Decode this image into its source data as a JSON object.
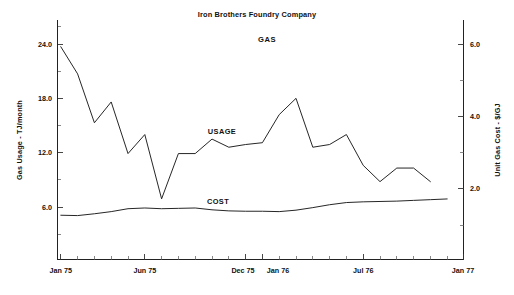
{
  "chart_data": {
    "type": "line",
    "title": "Iron Brothers Foundry Company",
    "subtitle": "GAS",
    "xlabel": "",
    "ylabel": "Gas Usage - TJ/month",
    "y2label": "Unit Gas Cost - $/GJ",
    "grid": false,
    "legend_position": "inline-annotation",
    "xlim": [
      "Jan 75",
      "Jan 77"
    ],
    "ylim": [
      0.0,
      26.0
    ],
    "y2lim": [
      0.0,
      6.5
    ],
    "yticks": [
      "6.0",
      "12.0",
      "18.0",
      "24.0"
    ],
    "ytick_values": [
      6.0,
      12.0,
      18.0,
      24.0
    ],
    "y2ticks": [
      "2.0",
      "4.0",
      "6.0"
    ],
    "y2tick_values": [
      2.0,
      4.0,
      6.0
    ],
    "xticks": [
      "Jan 75",
      "Jun 75",
      "Dec 75",
      "Jan 76",
      "Jul 76",
      "Jan 77"
    ],
    "xtick_months": [
      0,
      5,
      11,
      12,
      18,
      24
    ],
    "x_months": [
      0,
      1,
      2,
      3,
      4,
      5,
      6,
      7,
      8,
      9,
      10,
      11,
      12,
      13,
      14,
      15,
      16,
      17,
      18,
      19,
      20,
      21,
      22,
      23
    ],
    "series": [
      {
        "name": "USAGE",
        "axis": "left",
        "units": "TJ/month",
        "values": [
          23.7,
          20.7,
          15.3,
          17.6,
          11.9,
          14.0,
          6.9,
          11.9,
          11.9,
          13.5,
          12.6,
          12.9,
          13.1,
          16.2,
          18.0,
          12.6,
          12.9,
          14.0,
          10.6,
          8.8,
          10.3,
          10.3,
          8.8
        ]
      },
      {
        "name": "COST",
        "axis": "right",
        "units": "$/GJ",
        "values": [
          1.27,
          1.26,
          1.31,
          1.37,
          1.45,
          1.47,
          1.45,
          1.46,
          1.47,
          1.42,
          1.39,
          1.38,
          1.38,
          1.37,
          1.41,
          1.48,
          1.56,
          1.62,
          1.64,
          1.65,
          1.66,
          1.68,
          1.7,
          1.72
        ]
      }
    ],
    "annotations": [
      {
        "text": "USAGE",
        "x_px": 222,
        "y_px": 131
      },
      {
        "text": "COST",
        "x_px": 218,
        "y_px": 201
      }
    ]
  },
  "axes": {
    "left_title": "Gas Usage - TJ/month",
    "right_title": "Unit Gas Cost - $/GJ"
  },
  "labels": {
    "title": "Iron Brothers Foundry Company",
    "subtitle": "GAS",
    "usage": "USAGE",
    "cost": "COST",
    "y1": "6.0",
    "y2": "12.0",
    "y3": "18.0",
    "y4": "24.0",
    "r1": "2.0",
    "r2": "4.0",
    "r3": "6.0",
    "x1": "Jan 75",
    "x2": "Jun 75",
    "x3": "Dec 75",
    "x4": "Jan 76",
    "x5": "Jul 76",
    "x6": "Jan 77"
  },
  "colors": {
    "line": "#1a1a1a",
    "axis": "#222222",
    "background": "#ffffff"
  }
}
